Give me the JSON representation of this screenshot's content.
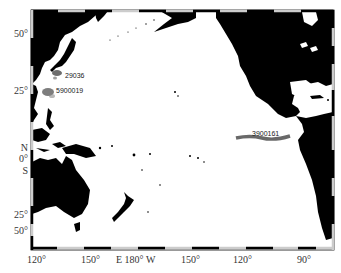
{
  "map": {
    "region": "Pacific Ocean",
    "frame_style": "alternating black/white graduated neatline",
    "land_color": "#000000",
    "ocean_color": "#ffffff",
    "latitude_labels": [
      {
        "text": "50°",
        "y": 29
      },
      {
        "text": "25°",
        "y": 86
      },
      {
        "text": "N",
        "y": 143
      },
      {
        "text": "0°",
        "y": 154
      },
      {
        "text": "S",
        "y": 166
      },
      {
        "text": "25°",
        "y": 210
      },
      {
        "text": "50°",
        "y": 249
      }
    ],
    "longitude_labels": [
      {
        "text": "120°",
        "x": 27
      },
      {
        "text": "150°",
        "x": 81
      },
      {
        "text": "E  180° W",
        "x": 116
      },
      {
        "text": "150°",
        "x": 181
      },
      {
        "text": "120°",
        "x": 233
      },
      {
        "text": "90°",
        "x": 297
      }
    ],
    "float_tracks": [
      {
        "id": "29036",
        "label_x": 65,
        "label_y": 72,
        "track_color": "#555555"
      },
      {
        "id": "5900019",
        "label_x": 56,
        "label_y": 87,
        "track_color": "#666666"
      },
      {
        "id": "3900161",
        "label_x": 252,
        "label_y": 133,
        "track_color": "#444444"
      }
    ]
  }
}
